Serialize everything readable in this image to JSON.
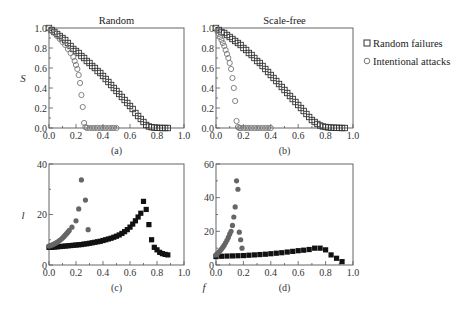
{
  "chart_data": [
    {
      "id": "a",
      "type": "scatter",
      "title": "Random",
      "caption": "(a)",
      "xlabel": "",
      "ylabel": "S",
      "xlim": [
        0,
        1
      ],
      "ylim": [
        0,
        1
      ],
      "xticks": [
        "0.0",
        "0.2",
        "0.4",
        "0.6",
        "0.8",
        "1.0"
      ],
      "yticks": [
        "0.0",
        "0.2",
        "0.4",
        "0.6",
        "0.8",
        "1.0"
      ],
      "series": [
        {
          "name": "Random failures",
          "marker": "open-square",
          "color": "#333333",
          "x": [
            0.0,
            0.02,
            0.04,
            0.06,
            0.08,
            0.1,
            0.12,
            0.14,
            0.16,
            0.18,
            0.2,
            0.22,
            0.24,
            0.26,
            0.28,
            0.3,
            0.32,
            0.34,
            0.36,
            0.38,
            0.4,
            0.42,
            0.44,
            0.46,
            0.48,
            0.5,
            0.52,
            0.54,
            0.56,
            0.58,
            0.6,
            0.62,
            0.64,
            0.66,
            0.68,
            0.7,
            0.72,
            0.74,
            0.76,
            0.78,
            0.8,
            0.82,
            0.84,
            0.86,
            0.88
          ],
          "y": [
            1.0,
            0.98,
            0.96,
            0.94,
            0.92,
            0.9,
            0.88,
            0.85,
            0.82,
            0.79,
            0.77,
            0.75,
            0.72,
            0.7,
            0.67,
            0.65,
            0.62,
            0.6,
            0.57,
            0.55,
            0.52,
            0.49,
            0.46,
            0.43,
            0.4,
            0.37,
            0.34,
            0.31,
            0.28,
            0.25,
            0.22,
            0.19,
            0.15,
            0.12,
            0.09,
            0.06,
            0.03,
            0.015,
            0.008,
            0.004,
            0.002,
            0.001,
            0.0,
            0.0,
            0.0
          ]
        },
        {
          "name": "Intentional attacks",
          "marker": "open-circle",
          "color": "#777777",
          "x": [
            0.0,
            0.02,
            0.04,
            0.06,
            0.08,
            0.1,
            0.12,
            0.14,
            0.16,
            0.18,
            0.19,
            0.2,
            0.21,
            0.22,
            0.23,
            0.24,
            0.25,
            0.26,
            0.27,
            0.28,
            0.3,
            0.32,
            0.34,
            0.36,
            0.38,
            0.4,
            0.42,
            0.44,
            0.46,
            0.48,
            0.5
          ],
          "y": [
            1.0,
            0.97,
            0.95,
            0.92,
            0.89,
            0.86,
            0.83,
            0.79,
            0.75,
            0.71,
            0.67,
            0.63,
            0.59,
            0.53,
            0.45,
            0.33,
            0.21,
            0.05,
            0.01,
            0.0,
            0.0,
            0.0,
            0.0,
            0.0,
            0.0,
            0.0,
            0.0,
            0.0,
            0.0,
            0.0,
            0.0
          ]
        }
      ]
    },
    {
      "id": "b",
      "type": "scatter",
      "title": "Scale-free",
      "caption": "(b)",
      "xlabel": "",
      "ylabel": "",
      "xlim": [
        0,
        1
      ],
      "ylim": [
        0,
        1
      ],
      "xticks": [
        "0.0",
        "0.2",
        "0.4",
        "0.6",
        "0.8",
        "1.0"
      ],
      "yticks": [
        "0.0",
        "0.2",
        "0.4",
        "0.6",
        "0.8",
        "1.0"
      ],
      "series": [
        {
          "name": "Random failures",
          "marker": "open-square",
          "color": "#333333",
          "x": [
            0.0,
            0.02,
            0.04,
            0.06,
            0.08,
            0.1,
            0.12,
            0.14,
            0.16,
            0.18,
            0.2,
            0.22,
            0.24,
            0.26,
            0.28,
            0.3,
            0.32,
            0.34,
            0.36,
            0.38,
            0.4,
            0.42,
            0.44,
            0.46,
            0.48,
            0.5,
            0.52,
            0.54,
            0.56,
            0.58,
            0.6,
            0.62,
            0.64,
            0.66,
            0.68,
            0.7,
            0.72,
            0.74,
            0.76,
            0.78,
            0.8,
            0.82,
            0.84,
            0.86,
            0.88,
            0.9,
            0.92,
            0.94
          ],
          "y": [
            1.0,
            0.98,
            0.96,
            0.95,
            0.93,
            0.91,
            0.89,
            0.87,
            0.85,
            0.83,
            0.8,
            0.78,
            0.75,
            0.73,
            0.7,
            0.67,
            0.65,
            0.62,
            0.59,
            0.56,
            0.53,
            0.5,
            0.47,
            0.44,
            0.41,
            0.38,
            0.35,
            0.32,
            0.29,
            0.26,
            0.23,
            0.2,
            0.17,
            0.14,
            0.11,
            0.08,
            0.06,
            0.04,
            0.025,
            0.015,
            0.01,
            0.006,
            0.004,
            0.003,
            0.002,
            0.001,
            0.0,
            0.0
          ]
        },
        {
          "name": "Intentional attacks",
          "marker": "open-circle",
          "color": "#777777",
          "x": [
            0.0,
            0.01,
            0.02,
            0.03,
            0.04,
            0.05,
            0.06,
            0.07,
            0.08,
            0.09,
            0.1,
            0.11,
            0.12,
            0.13,
            0.14,
            0.15,
            0.16,
            0.17,
            0.18,
            0.2,
            0.22,
            0.24,
            0.26,
            0.28,
            0.3,
            0.32,
            0.34,
            0.36,
            0.38,
            0.4
          ],
          "y": [
            1.0,
            0.97,
            0.94,
            0.91,
            0.88,
            0.85,
            0.82,
            0.78,
            0.74,
            0.7,
            0.65,
            0.59,
            0.5,
            0.4,
            0.27,
            0.07,
            0.01,
            0.0,
            0.0,
            0.0,
            0.0,
            0.0,
            0.0,
            0.0,
            0.0,
            0.0,
            0.0,
            0.0,
            0.0,
            0.0
          ]
        }
      ]
    },
    {
      "id": "c",
      "type": "scatter",
      "title": "",
      "caption": "(c)",
      "xlabel": "",
      "ylabel": "l",
      "xlim": [
        0,
        1
      ],
      "ylim": [
        0,
        40
      ],
      "xticks": [
        "0.0",
        "0.2",
        "0.4",
        "0.6",
        "0.8",
        "1.0"
      ],
      "yticks": [
        "0",
        "20",
        "40"
      ],
      "series": [
        {
          "name": "Random failures",
          "marker": "filled-square",
          "color": "#111111",
          "x": [
            0.0,
            0.02,
            0.04,
            0.06,
            0.08,
            0.1,
            0.12,
            0.14,
            0.16,
            0.18,
            0.2,
            0.22,
            0.24,
            0.26,
            0.28,
            0.3,
            0.32,
            0.34,
            0.36,
            0.38,
            0.4,
            0.42,
            0.44,
            0.46,
            0.48,
            0.5,
            0.52,
            0.54,
            0.56,
            0.58,
            0.6,
            0.62,
            0.64,
            0.66,
            0.68,
            0.7,
            0.72,
            0.74,
            0.76,
            0.78,
            0.8,
            0.82,
            0.84,
            0.86,
            0.88
          ],
          "y": [
            7.0,
            7.0,
            7.1,
            7.2,
            7.3,
            7.4,
            7.5,
            7.6,
            7.7,
            7.8,
            7.9,
            8.0,
            8.1,
            8.3,
            8.4,
            8.6,
            8.8,
            9.0,
            9.2,
            9.4,
            9.7,
            10.0,
            10.3,
            10.6,
            11.0,
            11.4,
            11.9,
            12.5,
            13.2,
            14.0,
            15.0,
            16.2,
            17.5,
            19.0,
            20.5,
            25.2,
            22.0,
            16.0,
            10.0,
            7.0,
            6.0,
            5.0,
            4.5,
            4.2,
            4.0
          ]
        },
        {
          "name": "Intentional attacks",
          "marker": "filled-circle",
          "color": "#666666",
          "x": [
            0.0,
            0.01,
            0.02,
            0.03,
            0.04,
            0.05,
            0.06,
            0.07,
            0.08,
            0.09,
            0.1,
            0.11,
            0.12,
            0.13,
            0.14,
            0.15,
            0.17,
            0.2,
            0.22,
            0.24,
            0.27,
            0.29
          ],
          "y": [
            7.5,
            7.7,
            7.9,
            8.1,
            8.4,
            8.7,
            9.0,
            9.4,
            9.8,
            10.2,
            10.7,
            11.2,
            11.8,
            12.4,
            13.0,
            13.7,
            15.0,
            17.5,
            22.2,
            33.7,
            25.7,
            14.0
          ]
        }
      ]
    },
    {
      "id": "d",
      "type": "scatter",
      "title": "",
      "caption": "(d)",
      "xlabel": "f",
      "ylabel": "",
      "xlim": [
        0,
        1
      ],
      "ylim": [
        0,
        60
      ],
      "xticks": [
        "0.0",
        "0.2",
        "0.4",
        "0.6",
        "0.8",
        "1.0"
      ],
      "yticks": [
        "0",
        "20",
        "40",
        "60"
      ],
      "series": [
        {
          "name": "Random failures",
          "marker": "filled-square",
          "color": "#111111",
          "x": [
            0.0,
            0.04,
            0.08,
            0.12,
            0.16,
            0.2,
            0.24,
            0.28,
            0.32,
            0.36,
            0.4,
            0.44,
            0.48,
            0.52,
            0.56,
            0.6,
            0.64,
            0.68,
            0.72,
            0.76,
            0.8,
            0.84,
            0.88,
            0.92
          ],
          "y": [
            5.0,
            5.2,
            5.3,
            5.4,
            5.5,
            5.6,
            5.8,
            6.0,
            6.2,
            6.4,
            6.7,
            7.0,
            7.3,
            7.7,
            8.1,
            8.5,
            8.8,
            9.2,
            10.0,
            10.0,
            9.0,
            6.0,
            4.0,
            2.0
          ]
        },
        {
          "name": "Intentional attacks",
          "marker": "filled-circle",
          "color": "#666666",
          "x": [
            0.0,
            0.01,
            0.02,
            0.03,
            0.04,
            0.05,
            0.06,
            0.07,
            0.08,
            0.09,
            0.1,
            0.11,
            0.12,
            0.13,
            0.14,
            0.15,
            0.16,
            0.17,
            0.18,
            0.19
          ],
          "y": [
            6.0,
            6.8,
            7.6,
            8.5,
            9.5,
            10.6,
            11.8,
            13.2,
            14.7,
            16.4,
            18.3,
            20.0,
            23.5,
            28.5,
            34.5,
            50.0,
            45.0,
            19.5,
            15.0,
            10.0
          ]
        }
      ]
    }
  ],
  "legend": {
    "items": [
      {
        "label": "Random failures",
        "marker": "open-square"
      },
      {
        "label": "Intentional attacks",
        "marker": "open-circle"
      }
    ]
  }
}
